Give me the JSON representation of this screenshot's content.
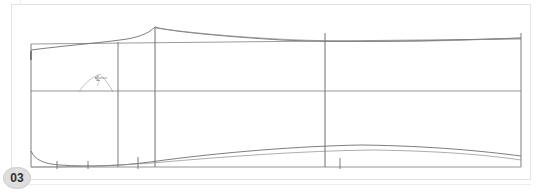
{
  "viewer": {
    "width": 542,
    "height": 193,
    "background": "#ffffff"
  },
  "page": {
    "badge_label": "03",
    "badge_color": "#dededf",
    "sheet_border_color": "#e3e3e3"
  },
  "drawing": {
    "title": "hull-profile-lines-plan",
    "line_color": "#6e6e6e",
    "light_line_color": "#9a9a9a",
    "annotation": {
      "arrow_glyph": "←",
      "callout_label": "7",
      "color": "#8b8b8b"
    },
    "frame": {
      "left_x": 31,
      "right_x": 521,
      "top_y": 33,
      "mid_y": 91,
      "bottom_y": 167
    },
    "stations": [
      {
        "name": "station-0",
        "x": 31,
        "top": 33,
        "bottom": 167
      },
      {
        "name": "station-1",
        "x": 118,
        "top": 33,
        "bottom": 167
      },
      {
        "name": "station-2",
        "x": 155,
        "top": 27,
        "bottom": 167
      },
      {
        "name": "station-3",
        "x": 325,
        "top": 33,
        "bottom": 167
      },
      {
        "name": "station-4",
        "x": 521,
        "top": 33,
        "bottom": 167
      }
    ],
    "tick_marks": [
      {
        "name": "tick-a",
        "x": 57,
        "y": 163,
        "len": 7
      },
      {
        "name": "tick-b",
        "x": 88,
        "y": 163,
        "len": 7
      },
      {
        "name": "tick-c",
        "x": 138,
        "y": 160,
        "len": 11
      },
      {
        "name": "tick-d",
        "x": 340,
        "y": 160,
        "len": 10
      },
      {
        "name": "tick-left-stem",
        "x": 31,
        "y": 55,
        "len": 9
      }
    ],
    "curves": {
      "sheer_upper": "M 31,50 C 60,46 100,42 120,39 C 138,37 148,33 155,27 C 170,32 230,37 280,40 C 340,43 430,41 521,38",
      "sheer_shadow": "M 31,44 C 70,42 110,41 140,40 C 200,41 260,43 330,42 C 410,41 470,40 521,39",
      "keel_lower": "M 31,152 C 36,160 44,164 60,165 C 90,167 120,166 150,162 C 220,153 300,147 360,146 C 430,147 480,152 521,157",
      "keel_lower_alt": "M 31,167 C 70,167 110,166 150,163 C 230,156 300,151 370,150 C 440,151 485,155 521,160"
    }
  }
}
